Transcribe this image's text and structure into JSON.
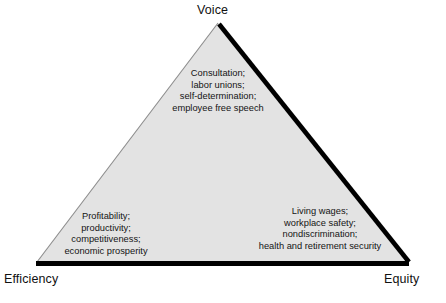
{
  "diagram": {
    "type": "triangle-framework",
    "fill_color": "#e3e3e3",
    "thick_stroke_color": "#000000",
    "thin_stroke_color": "#8c8c8c",
    "background_color": "#ffffff",
    "corners": {
      "apex": "Voice",
      "bottom_left": "Efficiency",
      "bottom_right": "Equity"
    },
    "facets": {
      "voice": {
        "label": "Voice",
        "lines": [
          "Consultation;",
          "labor unions;",
          "self-determination;",
          "employee free speech"
        ]
      },
      "efficiency": {
        "label": "Efficiency",
        "lines": [
          "Profitability;",
          "productivity;",
          "competitiveness;",
          "economic prosperity"
        ]
      },
      "equity": {
        "label": "Equity",
        "lines": [
          "Living wages;",
          "workplace safety;",
          "nondiscrimination;",
          "health and retirement security"
        ]
      }
    }
  }
}
